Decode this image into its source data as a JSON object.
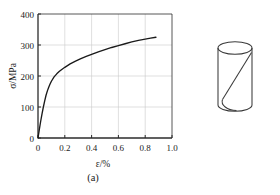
{
  "figure": {
    "panels": [
      {
        "key": "a",
        "caption": "(a)",
        "name": "stress-strain-curve"
      },
      {
        "key": "b",
        "caption": "(b)",
        "name": "cylinder-specimen"
      }
    ],
    "caption_a": "(a)",
    "caption_b": "(b)"
  },
  "chart_data": {
    "type": "line",
    "title": "",
    "xlabel": "ε/%",
    "ylabel": "σ/MPa",
    "xlim": [
      0,
      1.0
    ],
    "ylim": [
      0,
      400
    ],
    "xticks": [
      0,
      0.2,
      0.4,
      0.6,
      0.8,
      1.0
    ],
    "xticklabels": [
      "0",
      "0.2",
      "0.4",
      "0.6",
      "0.8",
      "1.0"
    ],
    "yticks": [
      0,
      100,
      200,
      300,
      400
    ],
    "yticklabels": [
      "0",
      "100",
      "200",
      "300",
      "400"
    ],
    "grid": true,
    "legend": null,
    "series": [
      {
        "name": "stress-strain",
        "color": "#1a1a1a",
        "x": [
          0.0,
          0.01,
          0.02,
          0.03,
          0.04,
          0.05,
          0.06,
          0.07,
          0.08,
          0.09,
          0.1,
          0.12,
          0.14,
          0.16,
          0.18,
          0.2,
          0.24,
          0.28,
          0.32,
          0.36,
          0.4,
          0.45,
          0.5,
          0.55,
          0.6,
          0.65,
          0.7,
          0.75,
          0.8,
          0.84,
          0.88
        ],
        "y": [
          0,
          28,
          54,
          78,
          100,
          120,
          138,
          152,
          164,
          174,
          183,
          197,
          207,
          215,
          222,
          228,
          239,
          248,
          256,
          263,
          270,
          278,
          285,
          292,
          298,
          304,
          310,
          315,
          319,
          322,
          325
        ]
      }
    ]
  },
  "specimen": {
    "shape": "cylinder",
    "fracture_line": "diagonal-shear-plane",
    "stroke_color": "#3a3a3a"
  }
}
